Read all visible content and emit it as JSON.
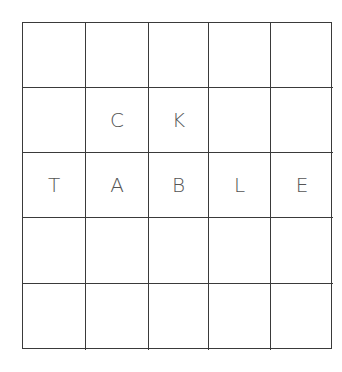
{
  "grid": {
    "rows": 5,
    "cols": 5,
    "cells": [
      [
        "",
        "",
        "",
        "",
        ""
      ],
      [
        "",
        "C",
        "K",
        "",
        ""
      ],
      [
        "T",
        "A",
        "B",
        "L",
        "E"
      ],
      [
        "",
        "",
        "",
        "",
        ""
      ],
      [
        "",
        "",
        "",
        "",
        ""
      ]
    ]
  },
  "colors": {
    "line": "#3a3a3a",
    "letter": "#555555",
    "background": "#ffffff"
  }
}
